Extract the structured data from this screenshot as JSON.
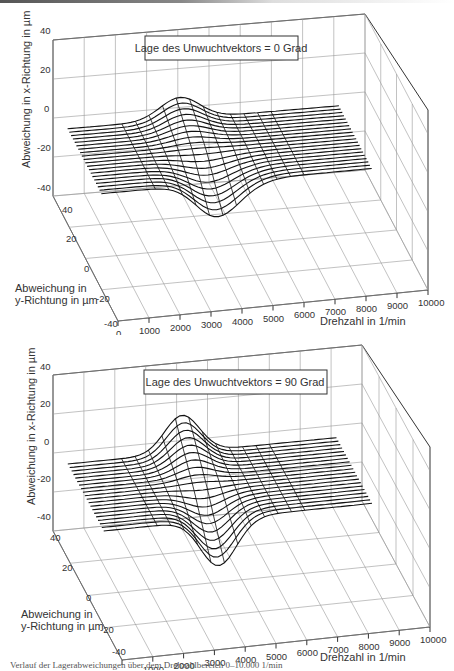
{
  "figure": {
    "caption": "Verlauf der Lagerabweichungen über dem Drehzahlbereich 0–10.000 1/min"
  },
  "charts": [
    {
      "id": "top",
      "legend": "Lage des Unwuchtvektors = 0 Grad",
      "zlabel": "Abweichung in x-Richtung in µm",
      "ylabel_line1": "Abweichung in",
      "ylabel_line2": "y-Richtung in µm",
      "xlabel": "Drehzahl in 1/min",
      "z_ticks": [
        "40",
        "20",
        "0",
        "-20",
        "-40"
      ],
      "y_ticks": [
        "40",
        "20",
        "0",
        "-20",
        "-40"
      ],
      "x_ticks": [
        "0",
        "1000",
        "2000",
        "3000",
        "4000",
        "5000",
        "6000",
        "7000",
        "8000",
        "9000",
        "10000"
      ]
    },
    {
      "id": "bottom",
      "legend": "Lage des Unwuchtvektors = 90 Grad",
      "zlabel": "Abweichung in x-Richtung in  µm",
      "ylabel_line1": "Abweichung in",
      "ylabel_line2": "y-Richtung in µm",
      "xlabel": "Drehzahl in 1/min",
      "z_ticks": [
        "40",
        "20",
        "0",
        "-20",
        "-40"
      ],
      "y_ticks": [
        "40",
        "20",
        "0",
        "-20",
        "-40"
      ],
      "x_ticks": [
        "0",
        "1000",
        "2000",
        "3000",
        "4000",
        "5000",
        "6000",
        "7000",
        "8000",
        "9000",
        "10000"
      ]
    }
  ],
  "chart_data": [
    {
      "type": "surface-wireframe-3d",
      "title": "Lage des Unwuchtvektors = 0 Grad",
      "xlabel": "Drehzahl in 1/min",
      "ylabel": "Abweichung in y-Richtung in µm",
      "zlabel": "Abweichung in x-Richtung in µm",
      "xlim": [
        0,
        10000
      ],
      "ylim": [
        -40,
        40
      ],
      "zlim": [
        -40,
        40
      ],
      "x_ticks": [
        0,
        1000,
        2000,
        3000,
        4000,
        5000,
        6000,
        7000,
        8000,
        9000,
        10000
      ],
      "y_ticks": [
        -40,
        -20,
        0,
        20,
        40
      ],
      "z_ticks": [
        -40,
        -20,
        0,
        20,
        40
      ],
      "grid": true,
      "n_traces": 20,
      "description": "Resonance region around 3500-5000 1/min; back traces rise to a hump (~+10 µm) while front traces dip to about -30 µm; traces flat near 0 elsewhere",
      "peak": {
        "x": 3800,
        "z_max_approx": 8,
        "z_min_approx": -30
      }
    },
    {
      "type": "surface-wireframe-3d",
      "title": "Lage des Unwuchtvektors = 90 Grad",
      "xlabel": "Drehzahl in 1/min",
      "ylabel": "Abweichung in y-Richtung in µm",
      "zlabel": "Abweichung in x-Richtung in µm",
      "xlim": [
        0,
        10000
      ],
      "ylim": [
        -40,
        40
      ],
      "zlim": [
        -40,
        40
      ],
      "x_ticks": [
        0,
        1000,
        2000,
        3000,
        4000,
        5000,
        6000,
        7000,
        8000,
        9000,
        10000
      ],
      "y_ticks": [
        -40,
        -20,
        0,
        20,
        40
      ],
      "z_ticks": [
        -40,
        -20,
        0,
        20,
        40
      ],
      "grid": true,
      "n_traces": 20,
      "description": "Pronounced resonance near 4000 1/min; back traces peak ~+20 µm, front traces dip to about -40 µm",
      "peak": {
        "x": 4000,
        "z_max_approx": 18,
        "z_min_approx": -38
      }
    }
  ]
}
